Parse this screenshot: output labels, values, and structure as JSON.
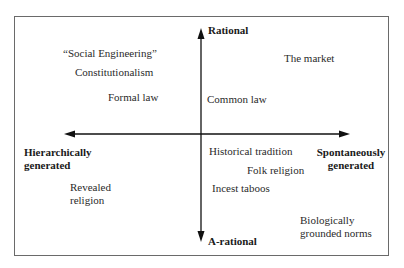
{
  "diagram": {
    "axes": {
      "vertical": {
        "top": "Rational",
        "bottom": "A-rational"
      },
      "horizontal": {
        "left_line1": "Hierarchically",
        "left_line2": "generated",
        "right_line1": "Spontaneously",
        "right_line2": "generated"
      }
    },
    "items": {
      "social_engineering": "“Social Engineering”",
      "constitutionalism": "Constitutionalism",
      "formal_law": "Formal law",
      "the_market": "The market",
      "common_law": "Common law",
      "historical_tradition": "Historical tradition",
      "folk_religion": "Folk religion",
      "incest_taboos": "Incest taboos",
      "revealed_religion_line1": "Revealed",
      "revealed_religion_line2": "religion",
      "biological_norms_line1": "Biologically",
      "biological_norms_line2": "grounded norms"
    }
  }
}
